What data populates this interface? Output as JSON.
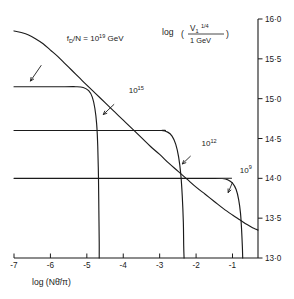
{
  "chart_data": {
    "type": "line",
    "title": "",
    "xlabel": "log (Nθ̄/π)",
    "ylabel": "log ( V₁ ¼ / 1 GeV )",
    "ylabel_parts": {
      "prefix": "log",
      "open_paren": "(",
      "numerator_base": "V",
      "numerator_sub": "1",
      "numerator_sup": "1/4",
      "denominator": "1 GeV",
      "close_paren": ")"
    },
    "xlabel_parts": {
      "prefix": "log",
      "open_paren": "(",
      "n": "N",
      "theta": "θ̄",
      "slash": "/",
      "pi": "π",
      "close_paren": ")"
    },
    "xlim": [
      -7.0,
      -0.3
    ],
    "ylim": [
      13.0,
      16.0
    ],
    "xticks": [
      -7,
      -6,
      -5,
      -4,
      -3,
      -2,
      -1
    ],
    "xtick_labels": [
      "-7",
      "-6",
      "-5",
      "-4",
      "-3",
      "-2",
      "-1"
    ],
    "yticks": [
      13.0,
      13.5,
      14.0,
      14.5,
      15.0,
      15.5,
      16.0
    ],
    "ytick_labels": [
      "13·0",
      "13·5",
      "14·0",
      "14·5",
      "15·0",
      "15·5",
      "16·0"
    ],
    "grid": false,
    "legend": "none",
    "annotations": [
      {
        "name": "main-curve-label",
        "text_prefix": "f",
        "text_sub": "D",
        "text_mid": "/N = 10",
        "text_sup": "19",
        "text_suffix": " GeV",
        "full_text": "f_D/N = 10^19 GeV",
        "x": -5.55,
        "y": 15.72,
        "arrow_from": [
          -6.25,
          15.42
        ],
        "arrow_to": [
          -6.55,
          15.22
        ]
      },
      {
        "name": "curve-label-1e15",
        "text_base": "10",
        "text_sup": "15",
        "full_text": "10^15",
        "x": -3.85,
        "y": 15.07,
        "arrow_from": [
          -4.25,
          14.93
        ],
        "arrow_to": [
          -4.55,
          14.8
        ]
      },
      {
        "name": "curve-label-1e12",
        "text_base": "10",
        "text_sup": "12",
        "full_text": "10^12",
        "x": -1.85,
        "y": 14.4,
        "arrow_from": [
          -2.15,
          14.28
        ],
        "arrow_to": [
          -2.38,
          14.18
        ]
      },
      {
        "name": "curve-label-1e9",
        "text_base": "10",
        "text_sup": "9",
        "full_text": "10^9",
        "x": -0.8,
        "y": 14.07,
        "arrow_from": [
          -1.0,
          13.95
        ],
        "arrow_to": [
          -1.12,
          13.82
        ]
      }
    ],
    "series": [
      {
        "name": "fD/N = 10^19 GeV",
        "label": "10^19",
        "points": [
          [
            -7.0,
            15.85
          ],
          [
            -6.8,
            15.83
          ],
          [
            -6.6,
            15.8
          ],
          [
            -6.4,
            15.75
          ],
          [
            -6.2,
            15.69
          ],
          [
            -6.0,
            15.61
          ],
          [
            -5.8,
            15.53
          ],
          [
            -5.6,
            15.44
          ],
          [
            -5.4,
            15.35
          ],
          [
            -5.2,
            15.26
          ],
          [
            -5.0,
            15.17
          ],
          [
            -4.75,
            15.06
          ],
          [
            -4.5,
            14.95
          ],
          [
            -4.25,
            14.84
          ],
          [
            -4.0,
            14.73
          ],
          [
            -3.75,
            14.62
          ],
          [
            -3.5,
            14.51
          ],
          [
            -3.25,
            14.4
          ],
          [
            -3.0,
            14.3
          ],
          [
            -2.75,
            14.19
          ],
          [
            -2.5,
            14.09
          ],
          [
            -2.25,
            13.99
          ],
          [
            -2.0,
            13.89
          ],
          [
            -1.75,
            13.8
          ],
          [
            -1.5,
            13.71
          ],
          [
            -1.25,
            13.62
          ],
          [
            -1.0,
            13.54
          ],
          [
            -0.8,
            13.48
          ],
          [
            -0.6,
            13.42
          ],
          [
            -0.45,
            13.38
          ],
          [
            -0.35,
            13.36
          ],
          [
            -0.3,
            13.35
          ]
        ]
      },
      {
        "name": "10^15 GeV",
        "label": "10^15",
        "plateau_y": 15.15,
        "plateau_x_start": -7.0,
        "knee_x": -4.95,
        "drop_x": -4.65,
        "drop_y_bottom": 13.0,
        "points": [
          [
            -7.0,
            15.15
          ],
          [
            -5.6,
            15.15
          ],
          [
            -5.3,
            15.15
          ],
          [
            -5.1,
            15.14
          ],
          [
            -4.95,
            15.1
          ],
          [
            -4.85,
            15.02
          ],
          [
            -4.78,
            14.88
          ],
          [
            -4.73,
            14.68
          ],
          [
            -4.7,
            14.4
          ],
          [
            -4.68,
            14.0
          ],
          [
            -4.67,
            13.6
          ],
          [
            -4.66,
            13.2
          ],
          [
            -4.66,
            13.0
          ]
        ]
      },
      {
        "name": "10^12 GeV",
        "label": "10^12",
        "plateau_y": 14.6,
        "plateau_x_start": -7.0,
        "knee_x": -2.62,
        "drop_x": -2.32,
        "drop_y_bottom": 13.0,
        "points": [
          [
            -7.0,
            14.6
          ],
          [
            -3.2,
            14.6
          ],
          [
            -2.95,
            14.6
          ],
          [
            -2.78,
            14.58
          ],
          [
            -2.66,
            14.53
          ],
          [
            -2.56,
            14.43
          ],
          [
            -2.48,
            14.27
          ],
          [
            -2.42,
            14.05
          ],
          [
            -2.38,
            13.78
          ],
          [
            -2.35,
            13.45
          ],
          [
            -2.34,
            13.15
          ],
          [
            -2.33,
            13.0
          ]
        ]
      },
      {
        "name": "10^9 GeV",
        "label": "10^9",
        "plateau_y": 14.0,
        "plateau_x_start": -7.0,
        "knee_x": -1.05,
        "drop_x": -0.75,
        "drop_y_bottom": 13.0,
        "points": [
          [
            -7.0,
            14.0
          ],
          [
            -1.5,
            14.0
          ],
          [
            -1.28,
            14.0
          ],
          [
            -1.12,
            13.98
          ],
          [
            -1.0,
            13.94
          ],
          [
            -0.9,
            13.86
          ],
          [
            -0.83,
            13.73
          ],
          [
            -0.78,
            13.56
          ],
          [
            -0.75,
            13.35
          ],
          [
            -0.73,
            13.15
          ],
          [
            -0.72,
            13.0
          ]
        ]
      }
    ]
  },
  "axes": {
    "y_axis_side": "right",
    "x_axis_side": "bottom"
  }
}
